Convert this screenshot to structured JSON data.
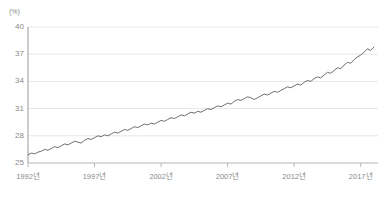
{
  "chart_data": {
    "type": "line",
    "title": "",
    "subtitle": "",
    "xlabel": "",
    "ylabel": "",
    "unit_label": "(%)",
    "grid": true,
    "legend": null,
    "ylim": [
      25,
      40
    ],
    "yticks": [
      25,
      28,
      31,
      34,
      37,
      40
    ],
    "ytick_labels": [
      "25",
      "28",
      "31",
      "34",
      "37",
      "40"
    ],
    "xlim": [
      1992,
      2018.3
    ],
    "xticks": [
      1992,
      1997,
      2002,
      2007,
      2012,
      2017
    ],
    "xtick_labels": [
      "1992년",
      "1997년",
      "2002년",
      "2007년",
      "2012년",
      "2017년"
    ],
    "series": [
      {
        "name": "",
        "color": "#6e6e6e",
        "x": [
          1992.0,
          1992.25,
          1992.5,
          1992.75,
          1993.0,
          1993.25,
          1993.5,
          1993.75,
          1994.0,
          1994.25,
          1994.5,
          1994.75,
          1995.0,
          1995.25,
          1995.5,
          1995.75,
          1996.0,
          1996.25,
          1996.5,
          1996.75,
          1997.0,
          1997.25,
          1997.5,
          1997.75,
          1998.0,
          1998.25,
          1998.5,
          1998.75,
          1999.0,
          1999.25,
          1999.5,
          1999.75,
          2000.0,
          2000.25,
          2000.5,
          2000.75,
          2001.0,
          2001.25,
          2001.5,
          2001.75,
          2002.0,
          2002.25,
          2002.5,
          2002.75,
          2003.0,
          2003.25,
          2003.5,
          2003.75,
          2004.0,
          2004.25,
          2004.5,
          2004.75,
          2005.0,
          2005.25,
          2005.5,
          2005.75,
          2006.0,
          2006.25,
          2006.5,
          2006.75,
          2007.0,
          2007.25,
          2007.5,
          2007.75,
          2008.0,
          2008.25,
          2008.5,
          2008.75,
          2009.0,
          2009.25,
          2009.5,
          2009.75,
          2010.0,
          2010.25,
          2010.5,
          2010.75,
          2011.0,
          2011.25,
          2011.5,
          2011.75,
          2012.0,
          2012.25,
          2012.5,
          2012.75,
          2013.0,
          2013.25,
          2013.5,
          2013.75,
          2014.0,
          2014.25,
          2014.5,
          2014.75,
          2015.0,
          2015.25,
          2015.5,
          2015.75,
          2016.0,
          2016.25,
          2016.5,
          2016.75,
          2017.0,
          2017.25,
          2017.5,
          2017.75,
          2018.0
        ],
        "values": [
          25.9,
          26.1,
          26.0,
          26.2,
          26.3,
          26.5,
          26.4,
          26.6,
          26.8,
          26.7,
          26.9,
          27.1,
          27.0,
          27.2,
          27.4,
          27.3,
          27.2,
          27.5,
          27.7,
          27.6,
          27.8,
          28.0,
          27.9,
          28.1,
          28.0,
          28.2,
          28.4,
          28.3,
          28.5,
          28.7,
          28.6,
          28.8,
          29.0,
          28.9,
          29.1,
          29.3,
          29.2,
          29.4,
          29.3,
          29.5,
          29.7,
          29.6,
          29.8,
          30.0,
          29.9,
          30.1,
          30.3,
          30.2,
          30.4,
          30.6,
          30.5,
          30.7,
          30.6,
          30.8,
          31.0,
          30.9,
          31.1,
          31.3,
          31.2,
          31.4,
          31.6,
          31.5,
          31.8,
          32.0,
          31.9,
          32.1,
          32.3,
          32.2,
          32.0,
          32.2,
          32.4,
          32.6,
          32.5,
          32.7,
          32.9,
          32.8,
          33.0,
          33.2,
          33.4,
          33.3,
          33.5,
          33.7,
          33.6,
          33.9,
          34.1,
          34.0,
          34.3,
          34.5,
          34.4,
          34.7,
          35.0,
          34.9,
          35.2,
          35.5,
          35.4,
          35.8,
          36.1,
          36.0,
          36.4,
          36.7,
          36.9,
          37.2,
          37.6,
          37.4,
          37.8
        ]
      }
    ]
  },
  "axes": {
    "y_unit": "(%)"
  }
}
